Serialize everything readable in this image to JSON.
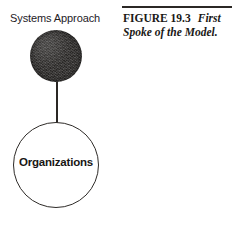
{
  "figure": {
    "diagram": {
      "top_label": "Systems Approach",
      "node_filled": {
        "name": "Systems Approach node",
        "fill_color": "#343230",
        "shape": "filled-circle"
      },
      "node_outline": {
        "label": "Organizations",
        "outline_color": "#2e2b28",
        "fill_color": "#ffffff",
        "shape": "outline-circle"
      },
      "connector": {
        "color": "#2a2724",
        "orientation": "vertical"
      }
    },
    "caption": {
      "rule_color": "#2b2825",
      "figure_number": "FIGURE 19.3",
      "title": "First Spoke of the Model.",
      "title_line_1": "First",
      "title_line_2": "Spoke of the Model."
    }
  },
  "page": {
    "background_color": "#ffffff",
    "text_color": "#1a1816"
  }
}
